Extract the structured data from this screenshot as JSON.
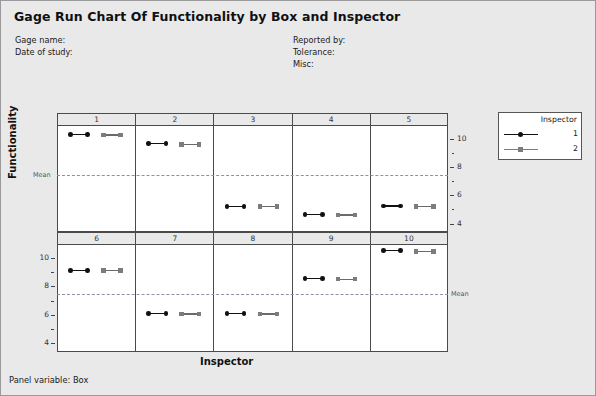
{
  "header": {
    "title": "Gage Run Chart Of Functionality by Box and Inspector",
    "gage_name_label": "Gage name:",
    "date_of_study_label": "Date of study:",
    "reported_by_label": "Reported by:",
    "tolerance_label": "Tolerance:",
    "misc_label": "Misc:"
  },
  "footer": {
    "panel_variable": "Panel variable: Box"
  },
  "legend": {
    "title": "Inspector",
    "entries": [
      {
        "label": "1",
        "marker": "circle-marker",
        "color": "#111111"
      },
      {
        "label": "2",
        "marker": "square-marker",
        "color": "#7c7c7c"
      }
    ]
  },
  "chart_data": {
    "type": "scatter",
    "title": "Gage Run Chart Of Functionality by Box and Inspector",
    "xlabel": "Inspector",
    "ylabel": "Functionality",
    "panel_variable": "Box",
    "panels": [
      "1",
      "2",
      "3",
      "4",
      "5",
      "6",
      "7",
      "8",
      "9",
      "10"
    ],
    "ylim": [
      3.4,
      10.9
    ],
    "yticks": [
      4,
      6,
      8,
      10
    ],
    "mean": 7.45,
    "mean_label": "Mean",
    "grid": false,
    "legend_position": "right",
    "series": [
      {
        "name": "1",
        "marker": "circle",
        "color": "#111111"
      },
      {
        "name": "2",
        "marker": "square",
        "color": "#7c7c7c"
      }
    ],
    "measurements": [
      {
        "box": "1",
        "inspector": "1",
        "values": [
          10.35,
          10.35
        ]
      },
      {
        "box": "1",
        "inspector": "2",
        "values": [
          10.3,
          10.3
        ]
      },
      {
        "box": "2",
        "inspector": "1",
        "values": [
          9.7,
          9.7
        ]
      },
      {
        "box": "2",
        "inspector": "2",
        "values": [
          9.65,
          9.65
        ]
      },
      {
        "box": "3",
        "inspector": "1",
        "values": [
          5.25,
          5.25
        ]
      },
      {
        "box": "3",
        "inspector": "2",
        "values": [
          5.25,
          5.25
        ]
      },
      {
        "box": "4",
        "inspector": "1",
        "values": [
          4.7,
          4.7
        ]
      },
      {
        "box": "4",
        "inspector": "2",
        "values": [
          4.65,
          4.65
        ]
      },
      {
        "box": "5",
        "inspector": "1",
        "values": [
          5.3,
          5.3
        ]
      },
      {
        "box": "5",
        "inspector": "2",
        "values": [
          5.25,
          5.25
        ]
      },
      {
        "box": "6",
        "inspector": "1",
        "values": [
          9.15,
          9.15
        ]
      },
      {
        "box": "6",
        "inspector": "2",
        "values": [
          9.15,
          9.15
        ]
      },
      {
        "box": "7",
        "inspector": "1",
        "values": [
          6.15,
          6.15
        ]
      },
      {
        "box": "7",
        "inspector": "2",
        "values": [
          6.1,
          6.1
        ]
      },
      {
        "box": "8",
        "inspector": "1",
        "values": [
          6.15,
          6.15
        ]
      },
      {
        "box": "8",
        "inspector": "2",
        "values": [
          6.1,
          6.1
        ]
      },
      {
        "box": "9",
        "inspector": "1",
        "values": [
          8.6,
          8.6
        ]
      },
      {
        "box": "9",
        "inspector": "2",
        "values": [
          8.55,
          8.55
        ]
      },
      {
        "box": "10",
        "inspector": "1",
        "values": [
          10.55,
          10.55
        ]
      },
      {
        "box": "10",
        "inspector": "2",
        "values": [
          10.5,
          10.5
        ]
      }
    ]
  },
  "axis": {
    "top_row_ticks": [
      "10",
      "8",
      "6",
      "4"
    ],
    "bottom_row_ticks": [
      "10",
      "8",
      "6",
      "4"
    ],
    "mean_label": "Mean"
  }
}
